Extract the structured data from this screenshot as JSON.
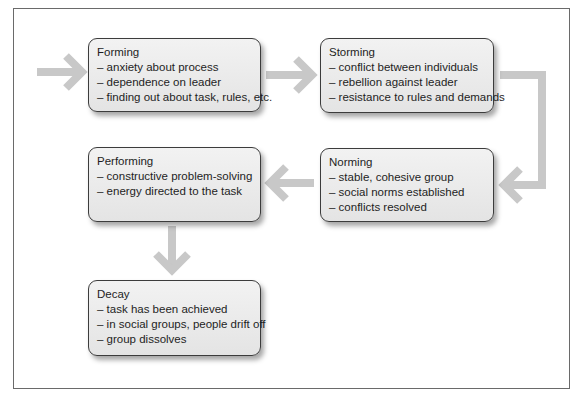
{
  "diagram": {
    "arrow_color": "#c8c8c8",
    "stages": [
      {
        "id": "forming",
        "title": "Forming",
        "items": [
          "– anxiety about process",
          "– dependence on leader",
          "– finding out about task, rules, etc."
        ]
      },
      {
        "id": "storming",
        "title": "Storming",
        "items": [
          "– conflict between individuals",
          "– rebellion against leader",
          "– resistance to rules and demands"
        ]
      },
      {
        "id": "norming",
        "title": "Norming",
        "items": [
          "– stable, cohesive group",
          "– social norms established",
          "– conflicts resolved"
        ]
      },
      {
        "id": "performing",
        "title": "Performing",
        "items": [
          "– constructive problem-solving",
          "– energy directed to the task"
        ]
      },
      {
        "id": "decay",
        "title": "Decay",
        "items": [
          "– task has been achieved",
          "– in social groups, people drift off",
          "– group dissolves"
        ]
      }
    ],
    "flow": [
      "entry → Forming",
      "Forming → Storming",
      "Storming → Norming",
      "Norming → Performing",
      "Performing → Decay"
    ]
  }
}
